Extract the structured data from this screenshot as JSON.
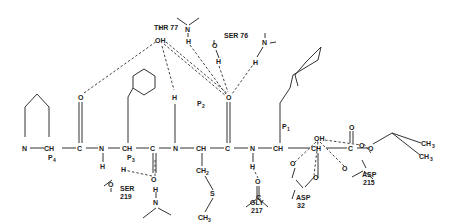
{
  "diagram": {
    "type": "chemical-structure",
    "backbone_atoms": [
      "N",
      "CH",
      "C",
      "N",
      "CH",
      "C",
      "N",
      "CH",
      "C",
      "N",
      "CH",
      "CH",
      "C",
      "O"
    ],
    "positions": [
      "P4",
      "P3",
      "P2",
      "P1"
    ],
    "residues": {
      "thr77": "THR 77",
      "ser76": "SER 76",
      "ser219": "SER\n219",
      "gly217": "GLY\n217",
      "asp32": "ASP\n32",
      "asp215": "ASP\n215"
    },
    "labels": {
      "oh": "OH",
      "o": "O",
      "n": "N",
      "h": "H",
      "c": "C",
      "ch": "CH",
      "ch2": "CH",
      "s": "S",
      "ch3": "CH",
      "p": "P",
      "sub2": "2",
      "sub3": "3",
      "sub4": "4",
      "sub1": "1"
    }
  }
}
